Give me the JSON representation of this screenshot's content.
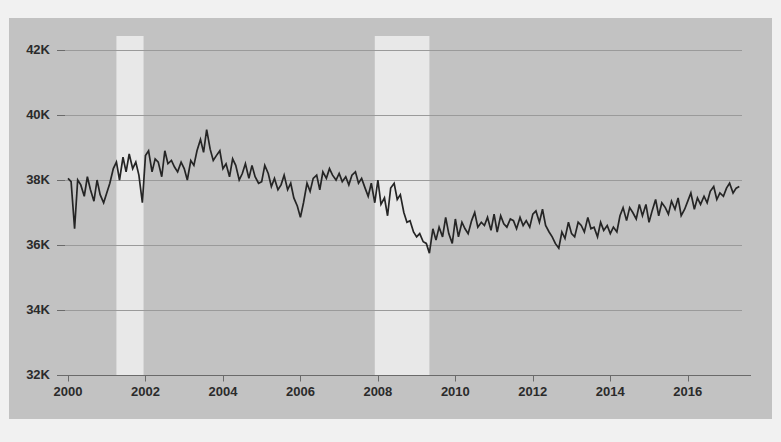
{
  "chart_data": {
    "type": "line",
    "title": "",
    "subtitle": "",
    "xlabel": "",
    "ylabel": "",
    "xlim": [
      2000.0,
      2017.4
    ],
    "ylim": [
      32000,
      42000
    ],
    "grid": true,
    "legend": null,
    "y_tick_labels": [
      "42K",
      "40K",
      "38K",
      "36K",
      "34K",
      "32K"
    ],
    "y_tick_values": [
      42000,
      40000,
      38000,
      36000,
      34000,
      32000
    ],
    "x_tick_labels": [
      "2000",
      "2002",
      "2004",
      "2006",
      "2008",
      "2010",
      "2012",
      "2014",
      "2016"
    ],
    "x_tick_values": [
      2000,
      2002,
      2004,
      2006,
      2008,
      2010,
      2012,
      2014,
      2016
    ],
    "colors": {
      "panel_background": "#c2c2c2",
      "page_background": "#f1f1f1",
      "line": "#252525",
      "gridline": "#9a9a9a",
      "axis": "#6a6a6a",
      "recession_band": "#e8e8e8",
      "tick_text": "#2b2b2b"
    },
    "annotations": [
      {
        "name": "recession-band-2001",
        "type": "vspan",
        "x_start": 2001.25,
        "x_end": 2001.95
      },
      {
        "name": "recession-band-2008",
        "type": "vspan",
        "x_start": 2007.92,
        "x_end": 2009.33
      }
    ],
    "series": [
      {
        "name": "value",
        "x": [
          2000.0,
          2000.08,
          2000.17,
          2000.25,
          2000.33,
          2000.42,
          2000.5,
          2000.58,
          2000.67,
          2000.75,
          2000.83,
          2000.92,
          2001.0,
          2001.08,
          2001.17,
          2001.25,
          2001.33,
          2001.42,
          2001.5,
          2001.58,
          2001.67,
          2001.75,
          2001.83,
          2001.92,
          2002.0,
          2002.08,
          2002.17,
          2002.25,
          2002.33,
          2002.42,
          2002.5,
          2002.58,
          2002.67,
          2002.75,
          2002.83,
          2002.92,
          2003.0,
          2003.08,
          2003.17,
          2003.25,
          2003.33,
          2003.42,
          2003.5,
          2003.58,
          2003.67,
          2003.75,
          2003.83,
          2003.92,
          2004.0,
          2004.08,
          2004.17,
          2004.25,
          2004.33,
          2004.42,
          2004.5,
          2004.58,
          2004.67,
          2004.75,
          2004.83,
          2004.92,
          2005.0,
          2005.08,
          2005.17,
          2005.25,
          2005.33,
          2005.42,
          2005.5,
          2005.58,
          2005.67,
          2005.75,
          2005.83,
          2005.92,
          2006.0,
          2006.08,
          2006.17,
          2006.25,
          2006.33,
          2006.42,
          2006.5,
          2006.58,
          2006.67,
          2006.75,
          2006.83,
          2006.92,
          2007.0,
          2007.08,
          2007.17,
          2007.25,
          2007.33,
          2007.42,
          2007.5,
          2007.58,
          2007.67,
          2007.75,
          2007.83,
          2007.92,
          2008.0,
          2008.08,
          2008.17,
          2008.25,
          2008.33,
          2008.42,
          2008.5,
          2008.58,
          2008.67,
          2008.75,
          2008.83,
          2008.92,
          2009.0,
          2009.08,
          2009.17,
          2009.25,
          2009.33,
          2009.42,
          2009.5,
          2009.58,
          2009.67,
          2009.75,
          2009.83,
          2009.92,
          2010.0,
          2010.08,
          2010.17,
          2010.25,
          2010.33,
          2010.42,
          2010.5,
          2010.58,
          2010.67,
          2010.75,
          2010.83,
          2010.92,
          2011.0,
          2011.08,
          2011.17,
          2011.25,
          2011.33,
          2011.42,
          2011.5,
          2011.58,
          2011.67,
          2011.75,
          2011.83,
          2011.92,
          2012.0,
          2012.08,
          2012.17,
          2012.25,
          2012.33,
          2012.42,
          2012.5,
          2012.58,
          2012.67,
          2012.75,
          2012.83,
          2012.92,
          2013.0,
          2013.08,
          2013.17,
          2013.25,
          2013.33,
          2013.42,
          2013.5,
          2013.58,
          2013.67,
          2013.75,
          2013.83,
          2013.92,
          2014.0,
          2014.08,
          2014.17,
          2014.25,
          2014.33,
          2014.42,
          2014.5,
          2014.58,
          2014.67,
          2014.75,
          2014.83,
          2014.92,
          2015.0,
          2015.08,
          2015.17,
          2015.25,
          2015.33,
          2015.42,
          2015.5,
          2015.58,
          2015.67,
          2015.75,
          2015.83,
          2015.92,
          2016.0,
          2016.08,
          2016.17,
          2016.25,
          2016.33,
          2016.42,
          2016.5,
          2016.58,
          2016.67,
          2016.75,
          2016.83,
          2016.92,
          2017.0,
          2017.08,
          2017.17,
          2017.25,
          2017.33
        ],
        "values": [
          38050,
          37950,
          36500,
          38000,
          37850,
          37500,
          38100,
          37700,
          37350,
          38000,
          37550,
          37300,
          37600,
          37900,
          38350,
          38550,
          38000,
          38700,
          38250,
          38800,
          38350,
          38550,
          38150,
          37300,
          38750,
          38900,
          38250,
          38650,
          38550,
          38100,
          38900,
          38500,
          38600,
          38400,
          38250,
          38550,
          38350,
          38000,
          38600,
          38450,
          38900,
          39250,
          38850,
          39550,
          38950,
          38600,
          38750,
          38900,
          38350,
          38500,
          38100,
          38650,
          38450,
          38000,
          38200,
          38500,
          38050,
          38450,
          38100,
          37900,
          37950,
          38450,
          38200,
          37800,
          38050,
          37700,
          37850,
          38150,
          37700,
          37900,
          37450,
          37200,
          36850,
          37300,
          37900,
          37650,
          38050,
          38150,
          37700,
          38250,
          38050,
          38350,
          38150,
          38000,
          38200,
          37950,
          38100,
          37850,
          38150,
          38250,
          37900,
          38050,
          37750,
          37500,
          37900,
          37300,
          38000,
          37250,
          37450,
          36900,
          37750,
          37900,
          37400,
          37550,
          37000,
          36700,
          36750,
          36400,
          36250,
          36350,
          36100,
          36050,
          35750,
          36500,
          36150,
          36550,
          36250,
          36850,
          36350,
          36050,
          36800,
          36250,
          36700,
          36500,
          36350,
          36750,
          37000,
          36550,
          36700,
          36600,
          36850,
          36450,
          36950,
          36400,
          36900,
          36650,
          36550,
          36800,
          36750,
          36500,
          36850,
          36600,
          36750,
          36550,
          36950,
          37050,
          36700,
          37100,
          36600,
          36400,
          36250,
          36050,
          35900,
          36400,
          36200,
          36700,
          36350,
          36250,
          36700,
          36600,
          36400,
          36850,
          36500,
          36550,
          36250,
          36700,
          36450,
          36600,
          36350,
          36550,
          36400,
          36900,
          37150,
          36750,
          37150,
          37000,
          36800,
          37250,
          36900,
          37250,
          36700,
          37050,
          37400,
          36900,
          37300,
          37150,
          36950,
          37350,
          37100,
          37450,
          36900,
          37100,
          37350,
          37600,
          37100,
          37450,
          37250,
          37500,
          37300,
          37650,
          37800,
          37400,
          37600,
          37500,
          37750,
          37900,
          37600,
          37750,
          37800
        ]
      }
    ]
  }
}
